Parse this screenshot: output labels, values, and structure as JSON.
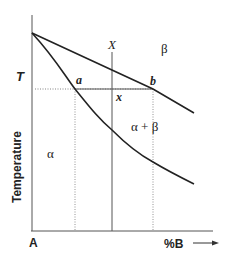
{
  "diagram": {
    "type": "binary-phase-diagram",
    "axes": {
      "y_label": "Temperature",
      "y_marker": "T",
      "x_origin_label": "A",
      "x_label": "%B",
      "x_arrow": "→"
    },
    "regions": {
      "liquid": "β",
      "two_phase": "α + β",
      "solid": "α"
    },
    "points": {
      "a": "a",
      "b": "b",
      "x": "x"
    },
    "composition_line": "X",
    "curves": {
      "upper": {
        "name": "liquidus",
        "points": [
          [
            32,
            33
          ],
          [
            153,
            89
          ],
          [
            194,
            113
          ]
        ]
      },
      "lower": {
        "name": "solidus",
        "points": [
          [
            32,
            33
          ],
          [
            75,
            89
          ],
          [
            112,
            128
          ],
          [
            153,
            162
          ],
          [
            194,
            184
          ]
        ]
      }
    },
    "tie_line": {
      "y": 89,
      "from_x": 75,
      "to_x": 153
    },
    "colors": {
      "line": "#222222",
      "axis": "#555555",
      "dotted": "#777777",
      "background": "#ffffff"
    }
  }
}
